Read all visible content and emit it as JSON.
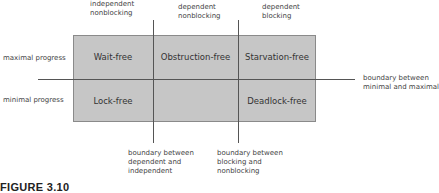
{
  "diagram": {
    "column_headers": [
      {
        "line1": "independent",
        "line2": "nonblocking"
      },
      {
        "line1": "dependent",
        "line2": "nonblocking"
      },
      {
        "line1": "dependent",
        "line2": "blocking"
      }
    ],
    "row_labels": [
      "maximal progress",
      "minimal progress"
    ],
    "cells": {
      "r0c0": "Wait-free",
      "r0c1": "Obstruction-free",
      "r0c2": "Starvation-free",
      "r1c0": "Lock-free",
      "r1c1": "",
      "r1c2": "Deadlock-free"
    },
    "boundaries": {
      "horizontal": {
        "line1": "boundary between",
        "line2": "minimal and maximal"
      },
      "vertical_left": {
        "line1": "boundary between",
        "line2": "dependent and",
        "line3": "independent"
      },
      "vertical_right": {
        "line1": "boundary between",
        "line2": "blocking and",
        "line3": "nonblocking"
      }
    },
    "caption": "FIGURE 3.10",
    "colors": {
      "cell_fill": "#c6c6c6",
      "border": "#8a8a8a",
      "line": "#555555"
    }
  }
}
